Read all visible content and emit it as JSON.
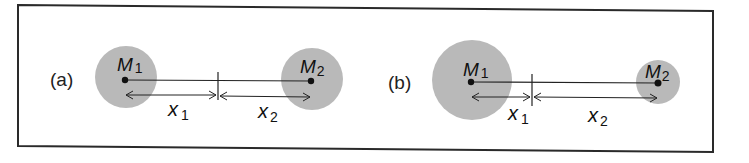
{
  "colors": {
    "frame": "#2a2a2a",
    "mass_fill": "#b9b9b9",
    "line": "#222222",
    "text": "#111111",
    "background": "#ffffff"
  },
  "panels": [
    {
      "label": "(a)",
      "masses": [
        {
          "name": "M",
          "subscript": "1",
          "cx": 126,
          "cy": 77,
          "r": 31
        },
        {
          "name": "M",
          "subscript": "2",
          "cx": 312,
          "cy": 79,
          "r": 31
        }
      ],
      "center_of_mass_x": 218,
      "distances": [
        {
          "name": "x",
          "subscript": "1"
        },
        {
          "name": "x",
          "subscript": "2"
        }
      ]
    },
    {
      "label": "(b)",
      "masses": [
        {
          "name": "M",
          "subscript": "1",
          "cx": 472,
          "cy": 80,
          "r": 40
        },
        {
          "name": "M",
          "subscript": "2",
          "cx": 658,
          "cy": 82,
          "r": 22
        }
      ],
      "center_of_mass_x": 532,
      "distances": [
        {
          "name": "x",
          "subscript": "1"
        },
        {
          "name": "x",
          "subscript": "2"
        }
      ]
    }
  ]
}
